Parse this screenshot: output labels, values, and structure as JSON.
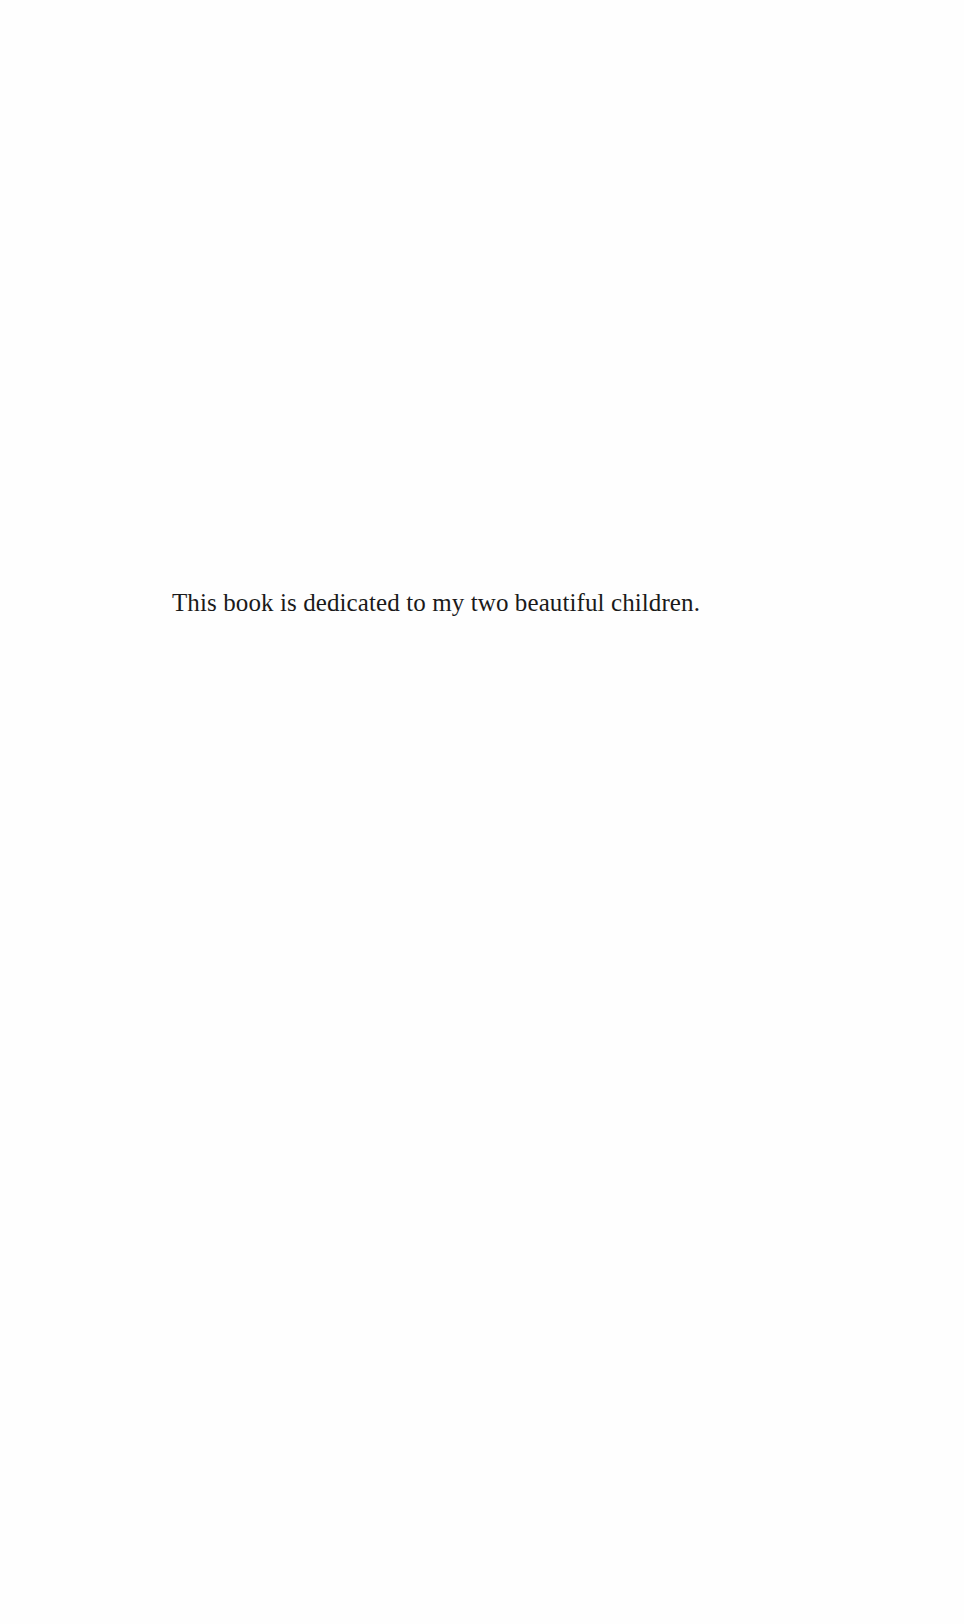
{
  "page": {
    "type": "dedication",
    "background_color": "#fefefe",
    "text_color": "#1a1a1a"
  },
  "dedication": {
    "text": "This book is dedicated to my two beautiful children."
  }
}
